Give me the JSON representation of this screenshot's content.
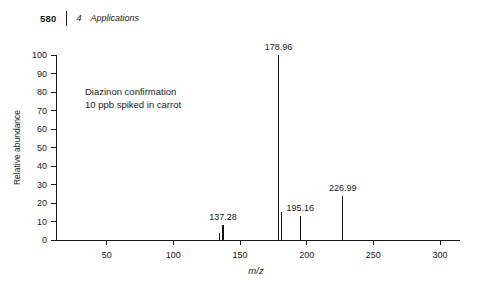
{
  "running_head": {
    "folio": "580",
    "chapter_number": "4",
    "chapter_title": "Applications"
  },
  "chart_data": {
    "type": "bar",
    "title": "",
    "subtitle": "",
    "xlabel": "m/z",
    "ylabel": "Relative abundance",
    "xlim": [
      12,
      312
    ],
    "ylim": [
      0,
      100
    ],
    "grid": false,
    "legend": null,
    "x_ticks": [
      50,
      100,
      150,
      200,
      250,
      300
    ],
    "x_tick_labels": [
      "50",
      "100",
      "150",
      "200",
      "250",
      "300"
    ],
    "y_ticks": [
      0,
      10,
      20,
      30,
      40,
      50,
      60,
      70,
      80,
      90,
      100
    ],
    "y_tick_labels": [
      "0",
      "10",
      "20",
      "30",
      "40",
      "50",
      "60",
      "70",
      "80",
      "90",
      "100"
    ],
    "x": [
      134.9,
      137.28,
      178.96,
      180.9,
      195.16,
      226.99
    ],
    "values": [
      4,
      8,
      100,
      15,
      13,
      24
    ],
    "peaks": [
      {
        "mz": 134.9,
        "abundance": 4,
        "label": ""
      },
      {
        "mz": 137.28,
        "abundance": 8,
        "label": "137.28"
      },
      {
        "mz": 178.96,
        "abundance": 100,
        "label": "178.96"
      },
      {
        "mz": 180.9,
        "abundance": 15,
        "label": ""
      },
      {
        "mz": 195.16,
        "abundance": 13,
        "label": "195.16"
      },
      {
        "mz": 226.99,
        "abundance": 24,
        "label": "226.99"
      }
    ],
    "annotations": [
      "Diazinon confirmation",
      "10 ppb spiked in carrot"
    ]
  },
  "colors": {
    "axis": "#1a1a1a",
    "peak": "#111111",
    "background": "#ffffff"
  }
}
